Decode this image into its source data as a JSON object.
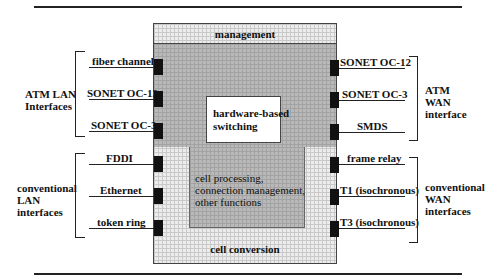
{
  "diagram": {
    "core": {
      "top_band": "management",
      "bottom_band": "cell conversion",
      "switching_box": [
        "hardware-based",
        "switching"
      ],
      "processing": [
        "cell processing,",
        "connection management,",
        "other functions"
      ]
    },
    "left_groups": [
      {
        "title": [
          "ATM LAN",
          "Interfaces"
        ],
        "ports": [
          "fiber channel",
          "SONET OC-12",
          "SONET OC-3"
        ]
      },
      {
        "title": [
          "conventional",
          "LAN",
          "interfaces"
        ],
        "ports": [
          "FDDI",
          "Ethernet",
          "token ring"
        ]
      }
    ],
    "right_groups": [
      {
        "title": [
          "ATM",
          "WAN",
          "interface"
        ],
        "ports": [
          "SONET OC-12",
          "SONET OC-3",
          "SMDS"
        ]
      },
      {
        "title": [
          "conventional",
          "WAN",
          "interfaces"
        ],
        "ports": [
          "frame relay",
          "T1 (isochronous)",
          "T3 (isochronous)"
        ]
      }
    ]
  }
}
